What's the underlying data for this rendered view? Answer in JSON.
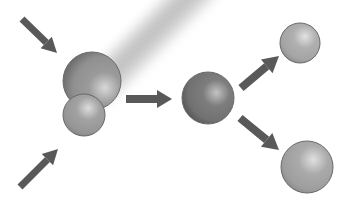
{
  "figure": {
    "background_color": "#ffffff",
    "width": 350,
    "height": 212
  },
  "palette": {
    "arrow_color": "#595959",
    "sphere_mid_gray": "#9a9a9a",
    "sphere_dark_gray": "#6e6e6e",
    "sphere_light_gray": "#b5b5b5",
    "sphere_outline": "#6a6a6a",
    "glow_band": "#c9c9c9"
  },
  "glow_band": {
    "name": "diagonal-light-band",
    "angle_deg": -45,
    "center_x": 92,
    "center_y": 95,
    "length": 210,
    "thickness": 52,
    "color": "#c4c4c4",
    "opacity": 0.55
  },
  "spheres": [
    {
      "id": "reactant-large",
      "label": "large reactant nucleus",
      "cx": 92,
      "cy": 81,
      "r": 29,
      "base_color": "#9b9b9b",
      "highlight_color": "#d8d8d8",
      "shadow_color": "#6f6f6f",
      "highlight_x_pct": 72,
      "highlight_y_pct": 62
    },
    {
      "id": "reactant-small",
      "label": "small reactant nucleus",
      "cx": 84,
      "cy": 115,
      "r": 21,
      "base_color": "#a2a2a2",
      "highlight_color": "#dcdcdc",
      "shadow_color": "#767676",
      "highlight_x_pct": 60,
      "highlight_y_pct": 34
    },
    {
      "id": "compound-nucleus",
      "label": "compound nucleus",
      "cx": 208,
      "cy": 98,
      "r": 26,
      "base_color": "#7d7d7d",
      "highlight_color": "#c3c3c3",
      "shadow_color": "#4e4e4e",
      "highlight_x_pct": 66,
      "highlight_y_pct": 40
    },
    {
      "id": "product-upper",
      "label": "upper fission product",
      "cx": 300,
      "cy": 43,
      "r": 20,
      "base_color": "#b0b0b0",
      "highlight_color": "#e2e2e2",
      "shadow_color": "#808080",
      "highlight_x_pct": 62,
      "highlight_y_pct": 34
    },
    {
      "id": "product-lower",
      "label": "lower fission product",
      "cx": 307,
      "cy": 167,
      "r": 26,
      "base_color": "#aaaaaa",
      "highlight_color": "#e0e0e0",
      "shadow_color": "#7c7c7c",
      "highlight_x_pct": 62,
      "highlight_y_pct": 36
    }
  ],
  "arrows": [
    {
      "id": "incoming-upper",
      "label": "incoming particle arrow, upper left",
      "x1": 22,
      "y1": 19,
      "x2": 57,
      "y2": 53,
      "width": 7,
      "head_length": 15,
      "head_width": 16,
      "color": "#595959",
      "direction": "down-right"
    },
    {
      "id": "incoming-lower",
      "label": "incoming particle arrow, lower left",
      "x1": 20,
      "y1": 187,
      "x2": 58,
      "y2": 149,
      "width": 7,
      "head_length": 15,
      "head_width": 16,
      "color": "#595959",
      "direction": "up-right"
    },
    {
      "id": "reaction-arrow",
      "label": "reaction arrow",
      "x1": 126,
      "y1": 99,
      "x2": 172,
      "y2": 99,
      "width": 8,
      "head_length": 15,
      "head_width": 18,
      "color": "#595959",
      "direction": "right"
    },
    {
      "id": "product-arrow-upper",
      "label": "fission product arrow, upper right",
      "x1": 241,
      "y1": 88,
      "x2": 279,
      "y2": 56,
      "width": 8,
      "head_length": 16,
      "head_width": 18,
      "color": "#595959",
      "direction": "up-right"
    },
    {
      "id": "product-arrow-lower",
      "label": "fission product arrow, lower right",
      "x1": 240,
      "y1": 118,
      "x2": 279,
      "y2": 150,
      "width": 8,
      "head_length": 16,
      "head_width": 18,
      "color": "#595959",
      "direction": "down-right"
    }
  ]
}
